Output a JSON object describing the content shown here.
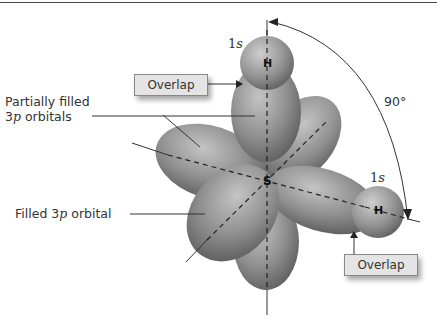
{
  "diagram": {
    "labels": {
      "partially_filled_line1": "Partially filled",
      "partially_filled_line2_prefix": "3",
      "partially_filled_line2_italic": "p",
      "partially_filled_line2_suffix": " orbitals",
      "filled_prefix": "Filled 3",
      "filled_italic": "p",
      "filled_suffix": " orbital",
      "angle": "90°"
    },
    "atoms": {
      "center": "S",
      "hydrogen_top": "H",
      "hydrogen_right": "H"
    },
    "orbital_labels": {
      "h_top_num": "1",
      "h_top_letter": "s",
      "h_right_num": "1",
      "h_right_letter": "s"
    },
    "callouts": {
      "overlap_top": "Overlap",
      "overlap_right": "Overlap"
    },
    "colors": {
      "lobe_light": "#b8b8b8",
      "lobe_dark": "#5a5a5a",
      "box_fill": "#e4e4e4",
      "line": "#333333"
    }
  }
}
